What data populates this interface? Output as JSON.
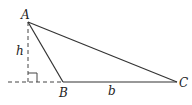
{
  "diagram": {
    "type": "geometry-triangle",
    "vertices": [
      {
        "name": "A",
        "label": "A"
      },
      {
        "name": "B",
        "label": "B"
      },
      {
        "name": "C",
        "label": "C"
      }
    ],
    "height_label": "h",
    "base_label": "b",
    "right_angle_marker": true,
    "colors": {
      "stroke": "#333333",
      "background": "#ffffff"
    }
  }
}
